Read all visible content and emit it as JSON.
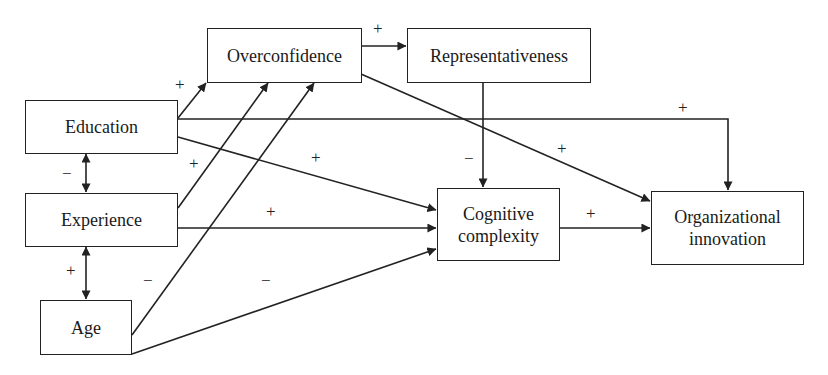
{
  "diagram": {
    "title": "",
    "nodes": [
      {
        "id": "overconfidence",
        "label": "Overconfidence"
      },
      {
        "id": "representativeness",
        "label": "Representativeness"
      },
      {
        "id": "education",
        "label": "Education"
      },
      {
        "id": "experience",
        "label": "Experience"
      },
      {
        "id": "age",
        "label": "Age"
      },
      {
        "id": "cognitive",
        "label_line1": "Cognitive",
        "label_line2": "complexity"
      },
      {
        "id": "innovation",
        "label_line1": "Organizational",
        "label_line2": "innovation"
      }
    ],
    "edges": [
      {
        "from": "overconfidence",
        "to": "representativeness",
        "sign": "+"
      },
      {
        "from": "education",
        "to": "overconfidence",
        "sign": "+"
      },
      {
        "from": "experience",
        "to": "overconfidence",
        "sign": "+"
      },
      {
        "from": "age",
        "to": "overconfidence",
        "sign": "−"
      },
      {
        "from": "education",
        "to": "innovation",
        "sign": "+"
      },
      {
        "from": "overconfidence",
        "to": "innovation",
        "sign": "+"
      },
      {
        "from": "representativeness",
        "to": "cognitive",
        "sign": "−"
      },
      {
        "from": "education",
        "to": "cognitive",
        "sign": "+"
      },
      {
        "from": "experience",
        "to": "cognitive",
        "sign": "+"
      },
      {
        "from": "age",
        "to": "cognitive",
        "sign": "−"
      },
      {
        "from": "cognitive",
        "to": "innovation",
        "sign": "+"
      },
      {
        "from": "education",
        "to": "experience",
        "sign": "−",
        "bidirectional": true
      },
      {
        "from": "experience",
        "to": "age",
        "sign": "+",
        "bidirectional": true
      }
    ]
  }
}
